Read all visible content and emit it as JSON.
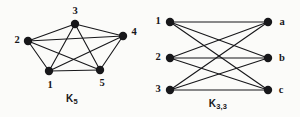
{
  "figure": {
    "background_color": "#fbfbf9",
    "ink_color": "#17171a",
    "width": 300,
    "height": 117
  },
  "graphs": [
    {
      "id": "k5",
      "name": "complete-graph-k5",
      "caption_base": "K",
      "caption_sub": "5",
      "caption_x": 72,
      "caption_y": 99,
      "edge_color": "#17171a",
      "edge_width": 1.1,
      "vertex_radius": 4.2,
      "vertex_color": "#17171a",
      "vertices": [
        {
          "id": "v1",
          "label": "1",
          "cx": 49,
          "cy": 71,
          "label_x": 50,
          "label_y": 85
        },
        {
          "id": "v2",
          "label": "2",
          "cx": 28,
          "cy": 41,
          "label_x": 17,
          "label_y": 40
        },
        {
          "id": "v3",
          "label": "3",
          "cx": 75,
          "cy": 24,
          "label_x": 75,
          "label_y": 11
        },
        {
          "id": "v4",
          "label": "4",
          "cx": 123,
          "cy": 36,
          "label_x": 134,
          "label_y": 32
        },
        {
          "id": "v5",
          "label": "5",
          "cx": 100,
          "cy": 70,
          "label_x": 102,
          "label_y": 83
        }
      ],
      "edges": [
        {
          "from": "v1",
          "to": "v2"
        },
        {
          "from": "v1",
          "to": "v3"
        },
        {
          "from": "v1",
          "to": "v4"
        },
        {
          "from": "v1",
          "to": "v5"
        },
        {
          "from": "v2",
          "to": "v3"
        },
        {
          "from": "v2",
          "to": "v4"
        },
        {
          "from": "v2",
          "to": "v5"
        },
        {
          "from": "v3",
          "to": "v4"
        },
        {
          "from": "v3",
          "to": "v5"
        },
        {
          "from": "v4",
          "to": "v5"
        }
      ]
    },
    {
      "id": "k33",
      "name": "complete-bipartite-graph-k33",
      "caption_base": "K",
      "caption_sub": "3,3",
      "caption_x": 218,
      "caption_y": 104,
      "edge_color": "#17171a",
      "edge_width": 1.1,
      "vertex_radius": 4.2,
      "vertex_color": "#17171a",
      "vertices": [
        {
          "id": "u1",
          "label": "1",
          "cx": 170,
          "cy": 22,
          "label_x": 158,
          "label_y": 21
        },
        {
          "id": "u2",
          "label": "2",
          "cx": 170,
          "cy": 58,
          "label_x": 158,
          "label_y": 57
        },
        {
          "id": "u3",
          "label": "3",
          "cx": 170,
          "cy": 90,
          "label_x": 158,
          "label_y": 89
        },
        {
          "id": "w1",
          "label": "a",
          "cx": 268,
          "cy": 22,
          "label_x": 282,
          "label_y": 22
        },
        {
          "id": "w2",
          "label": "b",
          "cx": 268,
          "cy": 58,
          "label_x": 282,
          "label_y": 58
        },
        {
          "id": "w3",
          "label": "c",
          "cx": 268,
          "cy": 90,
          "label_x": 281,
          "label_y": 90
        }
      ],
      "edges": [
        {
          "from": "u1",
          "to": "w1"
        },
        {
          "from": "u1",
          "to": "w2"
        },
        {
          "from": "u1",
          "to": "w3"
        },
        {
          "from": "u2",
          "to": "w1"
        },
        {
          "from": "u2",
          "to": "w2"
        },
        {
          "from": "u2",
          "to": "w3"
        },
        {
          "from": "u3",
          "to": "w1"
        },
        {
          "from": "u3",
          "to": "w2"
        },
        {
          "from": "u3",
          "to": "w3"
        }
      ]
    }
  ]
}
